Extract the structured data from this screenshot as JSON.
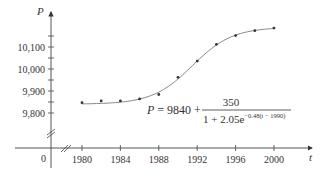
{
  "chart_data": {
    "type": "scatter",
    "title": "",
    "xlabel": "t",
    "ylabel": "P",
    "x_ticks": [
      1980,
      1984,
      1988,
      1992,
      1996,
      2000
    ],
    "x_tick_labels": [
      "1980",
      "1984",
      "1988",
      "1992",
      "1996",
      "2000"
    ],
    "y_ticks": [
      9800,
      9900,
      10000,
      10100
    ],
    "y_tick_labels": [
      "9,800",
      "9,900",
      "10,000",
      "10,100"
    ],
    "origin_label": "0",
    "xlim": [
      1980,
      2000
    ],
    "ylim": [
      9800,
      10200
    ],
    "axis_breaks": [
      "x",
      "y"
    ],
    "grid": false,
    "series": [
      {
        "name": "data points",
        "type": "scatter",
        "x": [
          1980,
          1982,
          1984,
          1986,
          1988,
          1990,
          1992,
          1994,
          1996,
          1998,
          2000
        ],
        "values": [
          9847,
          9855,
          9855,
          9864,
          9884,
          9962,
          10036,
          10112,
          10152,
          10174,
          10186
        ]
      },
      {
        "name": "logistic model",
        "type": "line",
        "formula": "P = 9840 + 350 / (1 + 2.05e^(-0.48(t - 1990)))"
      }
    ],
    "annotations": [
      {
        "text_lhs": "P = 9840 +",
        "numerator": "350",
        "denominator_base": "1 + 2.05e",
        "denominator_exponent": "−0.48(t − 1990)"
      }
    ]
  }
}
